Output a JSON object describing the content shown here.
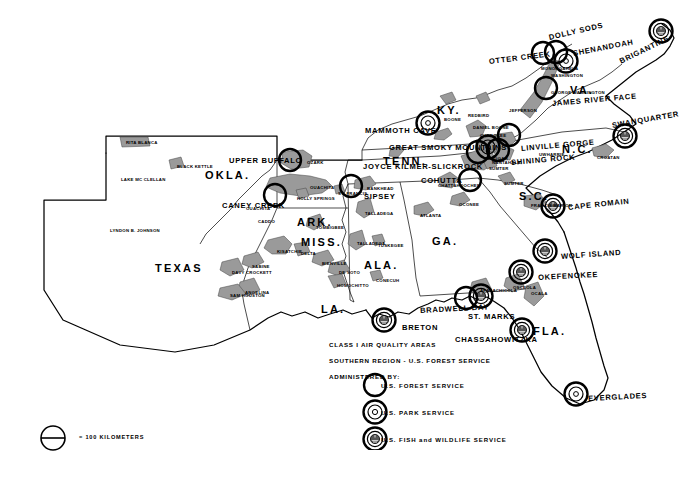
{
  "legend": {
    "line1": "CLASS I AIR QUALITY AREAS",
    "line2": "SOUTHERN REGION - U.S. FOREST SERVICE",
    "line3": "ADMINISTERED BY:",
    "items": [
      {
        "symbol": "plain-circle",
        "label": "U.S. FOREST SERVICE"
      },
      {
        "symbol": "double-circle-dot",
        "label": "U.S. PARK SERVICE"
      },
      {
        "symbol": "double-circle-emblem",
        "label": "U.S. FISH and WILDLIFE SERVICE"
      }
    ]
  },
  "scale": {
    "label": "= 100 KILOMETERS",
    "symbol": "circle-with-bar"
  },
  "colors": {
    "ink": "#000000",
    "paper": "#ffffff",
    "forest": "#8a8a8a",
    "forest_dark": "#6b6b6b"
  },
  "states": [
    {
      "name": "TEXAS",
      "x": 155,
      "y": 262,
      "size": "state"
    },
    {
      "name": "OKLA.",
      "x": 205,
      "y": 169,
      "size": "state"
    },
    {
      "name": "ARK.",
      "x": 297,
      "y": 216,
      "size": "state"
    },
    {
      "name": "MISS.",
      "x": 301,
      "y": 236,
      "size": "state"
    },
    {
      "name": "LA.",
      "x": 321,
      "y": 303,
      "size": "state"
    },
    {
      "name": "ALA.",
      "x": 364,
      "y": 259,
      "size": "state"
    },
    {
      "name": "GA.",
      "x": 432,
      "y": 235,
      "size": "state"
    },
    {
      "name": "FLA.",
      "x": 533,
      "y": 325,
      "size": "state"
    },
    {
      "name": "TENN.",
      "x": 383,
      "y": 155,
      "size": "state"
    },
    {
      "name": "KY.",
      "x": 437,
      "y": 104,
      "size": "state"
    },
    {
      "name": "VA.",
      "x": 570,
      "y": 84,
      "size": "state"
    },
    {
      "name": "N.C.",
      "x": 562,
      "y": 143,
      "size": "state"
    },
    {
      "name": "S.C.",
      "x": 519,
      "y": 190,
      "size": "state"
    }
  ],
  "class1_areas": [
    {
      "name": "OTTER CREEK",
      "label_x": 489,
      "label_y": 57,
      "rot": -7,
      "cx": 543,
      "cy": 53,
      "type": "forest"
    },
    {
      "name": "DOLLY SODS",
      "label_x": 549,
      "label_y": 33,
      "rot": -13,
      "cx": 556,
      "cy": 52,
      "type": "forest"
    },
    {
      "name": "SHENANDOAH",
      "label_x": 573,
      "label_y": 49,
      "rot": -11,
      "cx": 566,
      "cy": 61,
      "type": "park"
    },
    {
      "name": "BRIGANTINE",
      "label_x": 620,
      "label_y": 57,
      "rot": -26,
      "cx": 661,
      "cy": 31,
      "type": "fws"
    },
    {
      "name": "JAMES RIVER FACE",
      "label_x": 552,
      "label_y": 99,
      "rot": -5,
      "cx": 546,
      "cy": 88,
      "type": "forest"
    },
    {
      "name": "SWANQUARTER",
      "label_x": 612,
      "label_y": 121,
      "rot": -10,
      "cx": 625,
      "cy": 136,
      "type": "fws"
    },
    {
      "name": "LINVILLE GORGE",
      "label_x": 521,
      "label_y": 144,
      "rot": -5,
      "cx": 509,
      "cy": 135,
      "type": "forest"
    },
    {
      "name": "SHINING ROCK",
      "label_x": 511,
      "label_y": 158,
      "rot": -5,
      "cx": 498,
      "cy": 150,
      "type": "forest"
    },
    {
      "name": "GREAT SMOKY MOUNTAINS",
      "label_x": 389,
      "label_y": 143,
      "rot": 0,
      "cx": 488,
      "cy": 147,
      "type": "park"
    },
    {
      "name": "JOYCE KILMER-SLICKROCK",
      "label_x": 363,
      "label_y": 162,
      "rot": 0,
      "cx": 478,
      "cy": 152,
      "type": "forest"
    },
    {
      "name": "MAMMOTH CAVE",
      "label_x": 365,
      "label_y": 126,
      "rot": 0,
      "cx": 428,
      "cy": 123,
      "type": "park"
    },
    {
      "name": "COHUTTA",
      "label_x": 421,
      "label_y": 176,
      "rot": 0,
      "cx": 470,
      "cy": 180,
      "type": "forest"
    },
    {
      "name": "SIPSEY",
      "label_x": 364,
      "label_y": 192,
      "rot": 0,
      "cx": 351,
      "cy": 186,
      "type": "forest"
    },
    {
      "name": "UPPER BUFFALO",
      "label_x": 229,
      "label_y": 156,
      "rot": 0,
      "cx": 290,
      "cy": 160,
      "type": "forest"
    },
    {
      "name": "CANEY CREEK",
      "label_x": 222,
      "label_y": 201,
      "rot": 0,
      "cx": 275,
      "cy": 195,
      "type": "forest"
    },
    {
      "name": "CAPE ROMAIN",
      "label_x": 568,
      "label_y": 203,
      "rot": -6,
      "cx": 553,
      "cy": 206,
      "type": "fws"
    },
    {
      "name": "WOLF ISLAND",
      "label_x": 561,
      "label_y": 252,
      "rot": -4,
      "cx": 545,
      "cy": 251,
      "type": "fws"
    },
    {
      "name": "OKEFENOKEE",
      "label_x": 538,
      "label_y": 273,
      "rot": -3,
      "cx": 521,
      "cy": 272,
      "type": "fws"
    },
    {
      "name": "ST. MARKS",
      "label_x": 468,
      "label_y": 312,
      "rot": 0,
      "cx": 481,
      "cy": 296,
      "type": "fws"
    },
    {
      "name": "CHASSAHOWITZKA",
      "label_x": 455,
      "label_y": 335,
      "rot": 0,
      "cx": 522,
      "cy": 330,
      "type": "fws"
    },
    {
      "name": "BRADWELL BAY",
      "label_x": 420,
      "label_y": 306,
      "rot": -3,
      "cx": 466,
      "cy": 298,
      "type": "forest"
    },
    {
      "name": "BRETON",
      "label_x": 402,
      "label_y": 323,
      "rot": 0,
      "cx": 384,
      "cy": 320,
      "type": "fws"
    },
    {
      "name": "EVERGLADES",
      "label_x": 588,
      "label_y": 394,
      "rot": -3,
      "cx": 576,
      "cy": 394,
      "type": "park"
    }
  ],
  "national_forests": [
    {
      "name": "RITA BLANCA",
      "x": 126,
      "y": 140
    },
    {
      "name": "BLACK KETTLE",
      "x": 177,
      "y": 164
    },
    {
      "name": "LAKE MC CLELLAN",
      "x": 121,
      "y": 177
    },
    {
      "name": "LYNDON B. JOHNSON",
      "x": 110,
      "y": 228
    },
    {
      "name": "OZARK",
      "x": 307,
      "y": 160
    },
    {
      "name": "OUACHITA",
      "x": 310,
      "y": 185
    },
    {
      "name": "OUACHITA",
      "x": 246,
      "y": 206
    },
    {
      "name": "CADDO",
      "x": 258,
      "y": 219
    },
    {
      "name": "HOLLY SPRINGS",
      "x": 297,
      "y": 196
    },
    {
      "name": "ST. FRANCIS",
      "x": 338,
      "y": 191
    },
    {
      "name": "TOMBIGBEE",
      "x": 316,
      "y": 225
    },
    {
      "name": "DELTA",
      "x": 301,
      "y": 251
    },
    {
      "name": "BIENVILLE",
      "x": 322,
      "y": 261
    },
    {
      "name": "DE SOTO",
      "x": 339,
      "y": 270
    },
    {
      "name": "HOMOCHITTO",
      "x": 337,
      "y": 283
    },
    {
      "name": "KISATCHIE",
      "x": 277,
      "y": 249
    },
    {
      "name": "SABINE",
      "x": 252,
      "y": 264
    },
    {
      "name": "ANGELINA",
      "x": 245,
      "y": 290
    },
    {
      "name": "DAVY CROCKETT",
      "x": 232,
      "y": 270
    },
    {
      "name": "SAM HOUSTON",
      "x": 230,
      "y": 293
    },
    {
      "name": "BANKHEAD",
      "x": 367,
      "y": 186
    },
    {
      "name": "TALLADEGA",
      "x": 365,
      "y": 211
    },
    {
      "name": "TALLADEGA",
      "x": 357,
      "y": 241
    },
    {
      "name": "TUSKEGEE",
      "x": 378,
      "y": 243
    },
    {
      "name": "CONECUH",
      "x": 376,
      "y": 278
    },
    {
      "name": "ATLANTA",
      "x": 420,
      "y": 213
    },
    {
      "name": "CHATTAHOOCHEE",
      "x": 438,
      "y": 183
    },
    {
      "name": "OCONEE",
      "x": 459,
      "y": 202
    },
    {
      "name": "SUMTER",
      "x": 489,
      "y": 166
    },
    {
      "name": "SUMTER",
      "x": 504,
      "y": 181
    },
    {
      "name": "FRANCIS MARION",
      "x": 531,
      "y": 203
    },
    {
      "name": "CROATAN",
      "x": 597,
      "y": 155
    },
    {
      "name": "UWHARRIE",
      "x": 539,
      "y": 152
    },
    {
      "name": "NANTAHALA",
      "x": 492,
      "y": 160
    },
    {
      "name": "PISGAH",
      "x": 490,
      "y": 156
    },
    {
      "name": "CHEROKEE",
      "x": 480,
      "y": 133
    },
    {
      "name": "JEFFERSON",
      "x": 509,
      "y": 108
    },
    {
      "name": "WASHINGTON",
      "x": 551,
      "y": 73
    },
    {
      "name": "MONONGAHELA",
      "x": 541,
      "y": 66
    },
    {
      "name": "GEORGE WASHINGTON",
      "x": 551,
      "y": 90
    },
    {
      "name": "BOONE",
      "x": 444,
      "y": 117
    },
    {
      "name": "REDBIRD",
      "x": 468,
      "y": 113
    },
    {
      "name": "DANIEL BOONE",
      "x": 473,
      "y": 125
    },
    {
      "name": "OSCEOLA",
      "x": 513,
      "y": 285
    },
    {
      "name": "APALACHICOLA",
      "x": 480,
      "y": 288
    },
    {
      "name": "OCALA",
      "x": 531,
      "y": 291
    }
  ]
}
